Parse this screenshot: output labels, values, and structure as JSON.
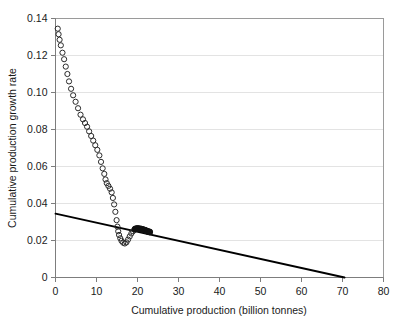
{
  "chart_data": {
    "type": "scatter",
    "title": "",
    "xlabel": "Cumulative production (billion tonnes)",
    "ylabel": "Cumulative production growth rate",
    "xlim": [
      0,
      80
    ],
    "ylim": [
      0,
      0.14
    ],
    "xticks": [
      0,
      10,
      20,
      30,
      40,
      50,
      60,
      70,
      80
    ],
    "xtick_labels": [
      "0",
      "10",
      "20",
      "30",
      "40",
      "50",
      "60",
      "70",
      "80"
    ],
    "yticks": [
      0,
      0.02,
      0.04,
      0.06,
      0.08,
      0.1,
      0.12,
      0.14
    ],
    "ytick_labels": [
      "0",
      "0.02",
      "0.04",
      "0.06",
      "0.08",
      "0.10",
      "0.12",
      "0.14"
    ],
    "grid": "horizontal",
    "legend": "none",
    "series": [
      {
        "name": "Observed cumulative production growth rate",
        "marker": "open-circle",
        "marker_color": "#2b2b2b",
        "points": [
          [
            0.55,
            0.1345
          ],
          [
            0.75,
            0.1315
          ],
          [
            1.0,
            0.1285
          ],
          [
            1.3,
            0.1255
          ],
          [
            1.7,
            0.1215
          ],
          [
            2.1,
            0.118
          ],
          [
            2.5,
            0.114
          ],
          [
            2.9,
            0.11
          ],
          [
            3.3,
            0.106
          ],
          [
            3.8,
            0.102
          ],
          [
            4.3,
            0.0985
          ],
          [
            4.9,
            0.095
          ],
          [
            5.5,
            0.0915
          ],
          [
            6.1,
            0.088
          ],
          [
            6.7,
            0.0855
          ],
          [
            7.2,
            0.0835
          ],
          [
            7.7,
            0.0815
          ],
          [
            8.2,
            0.079
          ],
          [
            8.7,
            0.0765
          ],
          [
            9.2,
            0.074
          ],
          [
            9.7,
            0.0715
          ],
          [
            10.2,
            0.069
          ],
          [
            10.7,
            0.066
          ],
          [
            11.1,
            0.0625
          ],
          [
            11.5,
            0.059
          ],
          [
            11.9,
            0.056
          ],
          [
            12.2,
            0.053
          ],
          [
            12.5,
            0.051
          ],
          [
            12.9,
            0.0495
          ],
          [
            13.3,
            0.048
          ],
          [
            13.7,
            0.046
          ],
          [
            14.0,
            0.043
          ],
          [
            14.3,
            0.0395
          ],
          [
            14.6,
            0.0355
          ],
          [
            14.9,
            0.031
          ],
          [
            15.1,
            0.0275
          ],
          [
            15.3,
            0.025
          ],
          [
            15.5,
            0.023
          ],
          [
            15.8,
            0.0212
          ],
          [
            16.1,
            0.0198
          ],
          [
            16.5,
            0.0188
          ],
          [
            16.9,
            0.0184
          ],
          [
            17.3,
            0.019
          ],
          [
            17.7,
            0.0205
          ],
          [
            18.1,
            0.0222
          ],
          [
            18.5,
            0.0238
          ],
          [
            18.9,
            0.025
          ],
          [
            19.3,
            0.0258
          ]
        ]
      },
      {
        "name": "Dense recent cluster",
        "marker": "filled-circle",
        "marker_color": "#111111",
        "points": [
          [
            19.4,
            0.0262
          ],
          [
            19.7,
            0.0264
          ],
          [
            20.0,
            0.0265
          ],
          [
            20.3,
            0.0264
          ],
          [
            20.6,
            0.0263
          ],
          [
            20.9,
            0.0262
          ],
          [
            21.2,
            0.026
          ],
          [
            21.5,
            0.0258
          ],
          [
            21.8,
            0.0256
          ],
          [
            22.1,
            0.0253
          ],
          [
            22.4,
            0.025
          ],
          [
            22.7,
            0.0248
          ],
          [
            23.0,
            0.0246
          ]
        ]
      }
    ],
    "trend_line": {
      "name": "Linear fit to declining growth rate",
      "color": "#000000",
      "x_start": 0.0,
      "y_start": 0.0345,
      "x_end": 70.5,
      "y_end": 0.0
    }
  }
}
